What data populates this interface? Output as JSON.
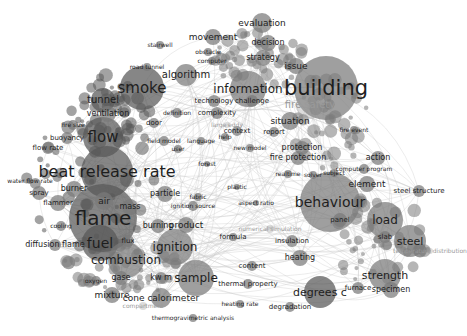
{
  "visualization": {
    "type": "keyword co-occurrence network",
    "background": "#ffffff",
    "edge_color": "#c8c8c8",
    "node_colors": {
      "dark": "#585858",
      "mid": "#7a7a7a",
      "light": "#9c9c9c"
    }
  },
  "nodes": [
    {
      "label": "building",
      "x": 326,
      "y": 88,
      "r": 32,
      "fs": 21,
      "shade": "mid"
    },
    {
      "label": "flame",
      "x": 103,
      "y": 218,
      "r": 34,
      "fs": 20,
      "shade": "dark"
    },
    {
      "label": "beat release rate",
      "x": 107,
      "y": 172,
      "r": 26,
      "fs": 16,
      "shade": "dark"
    },
    {
      "label": "behaviour",
      "x": 330,
      "y": 202,
      "r": 30,
      "fs": 14,
      "shade": "mid"
    },
    {
      "label": "smoke",
      "x": 142,
      "y": 88,
      "r": 22,
      "fs": 15,
      "shade": "dark"
    },
    {
      "label": "flow",
      "x": 103,
      "y": 137,
      "r": 20,
      "fs": 15,
      "shade": "dark"
    },
    {
      "label": "fuel",
      "x": 100,
      "y": 243,
      "r": 18,
      "fs": 14,
      "shade": "dark"
    },
    {
      "label": "information",
      "x": 248,
      "y": 89,
      "r": 18,
      "fs": 12,
      "shade": "mid"
    },
    {
      "label": "combustion",
      "x": 126,
      "y": 260,
      "r": 18,
      "fs": 12,
      "shade": "mid"
    },
    {
      "label": "ignition",
      "x": 175,
      "y": 247,
      "r": 18,
      "fs": 12,
      "shade": "mid"
    },
    {
      "label": "sample",
      "x": 196,
      "y": 278,
      "r": 18,
      "fs": 12,
      "shade": "mid"
    },
    {
      "label": "load",
      "x": 385,
      "y": 220,
      "r": 18,
      "fs": 12,
      "shade": "mid"
    },
    {
      "label": "steel",
      "x": 410,
      "y": 241,
      "r": 16,
      "fs": 11,
      "shade": "mid"
    },
    {
      "label": "strength",
      "x": 385,
      "y": 275,
      "r": 16,
      "fs": 11,
      "shade": "mid"
    },
    {
      "label": "degrees c",
      "x": 320,
      "y": 292,
      "r": 16,
      "fs": 11,
      "shade": "dark"
    },
    {
      "label": "fire safety",
      "x": 310,
      "y": 105,
      "r": 14,
      "fs": 10,
      "shade": "light",
      "faint": true
    },
    {
      "label": "tunnel",
      "x": 103,
      "y": 100,
      "r": 12,
      "fs": 10,
      "shade": "dark"
    },
    {
      "label": "algorithm",
      "x": 186,
      "y": 75,
      "r": 11,
      "fs": 10,
      "shade": "mid"
    },
    {
      "label": "evaluation",
      "x": 262,
      "y": 23,
      "r": 10,
      "fs": 9,
      "shade": "mid"
    },
    {
      "label": "movement",
      "x": 213,
      "y": 37,
      "r": 8,
      "fs": 9,
      "shade": "mid"
    },
    {
      "label": "decision",
      "x": 268,
      "y": 43,
      "r": 8,
      "fs": 8,
      "shade": "mid"
    },
    {
      "label": "strategy",
      "x": 263,
      "y": 58,
      "r": 8,
      "fs": 8,
      "shade": "mid"
    },
    {
      "label": "issue",
      "x": 296,
      "y": 66,
      "r": 8,
      "fs": 9,
      "shade": "mid"
    },
    {
      "label": "situation",
      "x": 290,
      "y": 121,
      "r": 9,
      "fs": 9,
      "shade": "mid"
    },
    {
      "label": "ventilation",
      "x": 108,
      "y": 114,
      "r": 8,
      "fs": 8,
      "shade": "mid"
    },
    {
      "label": "technology",
      "x": 214,
      "y": 101,
      "r": 6,
      "fs": 7,
      "shade": "mid"
    },
    {
      "label": "challenge",
      "x": 252,
      "y": 101,
      "r": 6,
      "fs": 7,
      "shade": "mid"
    },
    {
      "label": "complexity",
      "x": 217,
      "y": 113,
      "r": 6,
      "fs": 7,
      "shade": "mid"
    },
    {
      "label": "definition",
      "x": 177,
      "y": 113,
      "r": 5,
      "fs": 6,
      "shade": "mid"
    },
    {
      "label": "context",
      "x": 237,
      "y": 131,
      "r": 5,
      "fs": 7,
      "shade": "mid"
    },
    {
      "label": "report",
      "x": 274,
      "y": 132,
      "r": 5,
      "fs": 7,
      "shade": "mid"
    },
    {
      "label": "protection",
      "x": 302,
      "y": 148,
      "r": 7,
      "fs": 8,
      "shade": "mid"
    },
    {
      "label": "fire protection",
      "x": 298,
      "y": 158,
      "r": 7,
      "fs": 8,
      "shade": "mid"
    },
    {
      "label": "action",
      "x": 378,
      "y": 158,
      "r": 7,
      "fs": 8,
      "shade": "mid"
    },
    {
      "label": "element",
      "x": 367,
      "y": 184,
      "r": 8,
      "fs": 9,
      "shade": "mid"
    },
    {
      "label": "panel",
      "x": 340,
      "y": 220,
      "r": 7,
      "fs": 7,
      "shade": "mid"
    },
    {
      "label": "slab",
      "x": 385,
      "y": 237,
      "r": 6,
      "fs": 7,
      "shade": "mid"
    },
    {
      "label": "steel structure",
      "x": 419,
      "y": 191,
      "r": 6,
      "fs": 7,
      "shade": "mid"
    },
    {
      "label": "computer program",
      "x": 364,
      "y": 169,
      "r": 5,
      "fs": 6,
      "shade": "mid"
    },
    {
      "label": "specimen",
      "x": 391,
      "y": 290,
      "r": 8,
      "fs": 8,
      "shade": "mid"
    },
    {
      "label": "furnace",
      "x": 358,
      "y": 288,
      "r": 6,
      "fs": 7,
      "shade": "mid"
    },
    {
      "label": "heating",
      "x": 300,
      "y": 258,
      "r": 8,
      "fs": 8,
      "shade": "mid"
    },
    {
      "label": "insulation",
      "x": 292,
      "y": 241,
      "r": 6,
      "fs": 7,
      "shade": "mid"
    },
    {
      "label": "content",
      "x": 252,
      "y": 266,
      "r": 5,
      "fs": 7,
      "shade": "mid"
    },
    {
      "label": "degradation",
      "x": 290,
      "y": 307,
      "r": 5,
      "fs": 7,
      "shade": "mid"
    },
    {
      "label": "thermal property",
      "x": 248,
      "y": 284,
      "r": 5,
      "fs": 7,
      "shade": "mid"
    },
    {
      "label": "heating rate",
      "x": 240,
      "y": 304,
      "r": 4,
      "fs": 6,
      "shade": "mid"
    },
    {
      "label": "thermogravimetric analysis",
      "x": 193,
      "y": 318,
      "r": 4,
      "fs": 6,
      "shade": "mid"
    },
    {
      "label": "cone calorimeter",
      "x": 161,
      "y": 298,
      "r": 10,
      "fs": 9,
      "shade": "mid"
    },
    {
      "label": "mixture",
      "x": 112,
      "y": 295,
      "r": 8,
      "fs": 9,
      "shade": "mid"
    },
    {
      "label": "gase",
      "x": 121,
      "y": 278,
      "r": 7,
      "fs": 8,
      "shade": "mid"
    },
    {
      "label": "kw m",
      "x": 161,
      "y": 278,
      "r": 6,
      "fs": 8,
      "shade": "mid"
    },
    {
      "label": "oxygen",
      "x": 96,
      "y": 281,
      "r": 5,
      "fs": 6,
      "shade": "mid"
    },
    {
      "label": "product",
      "x": 186,
      "y": 225,
      "r": 8,
      "fs": 9,
      "shade": "mid"
    },
    {
      "label": "burning",
      "x": 158,
      "y": 226,
      "r": 7,
      "fs": 8,
      "shade": "mid"
    },
    {
      "label": "particle",
      "x": 165,
      "y": 194,
      "r": 8,
      "fs": 8,
      "shade": "mid"
    },
    {
      "label": "ignition source",
      "x": 193,
      "y": 206,
      "r": 5,
      "fs": 6,
      "shade": "mid"
    },
    {
      "label": "fabric",
      "x": 198,
      "y": 197,
      "r": 4,
      "fs": 6,
      "shade": "mid"
    },
    {
      "label": "mass",
      "x": 130,
      "y": 207,
      "r": 8,
      "fs": 8,
      "shade": "mid"
    },
    {
      "label": "air",
      "x": 104,
      "y": 201,
      "r": 9,
      "fs": 9,
      "shade": "mid"
    },
    {
      "label": "flux",
      "x": 128,
      "y": 241,
      "r": 6,
      "fs": 7,
      "shade": "mid"
    },
    {
      "label": "burner",
      "x": 74,
      "y": 189,
      "r": 8,
      "fs": 8,
      "shade": "mid"
    },
    {
      "label": "flammer",
      "x": 58,
      "y": 203,
      "r": 8,
      "fs": 7,
      "shade": "mid"
    },
    {
      "label": "spray",
      "x": 39,
      "y": 193,
      "r": 7,
      "fs": 7,
      "shade": "mid"
    },
    {
      "label": "water flow rate",
      "x": 30,
      "y": 181,
      "r": 3,
      "fs": 6,
      "shade": "mid"
    },
    {
      "label": "cooling",
      "x": 61,
      "y": 226,
      "r": 5,
      "fs": 6,
      "shade": "mid"
    },
    {
      "label": "diffusion flame",
      "x": 55,
      "y": 245,
      "r": 6,
      "fs": 8,
      "shade": "mid"
    },
    {
      "label": "buoyancy",
      "x": 67,
      "y": 138,
      "r": 6,
      "fs": 7,
      "shade": "mid"
    },
    {
      "label": "flow rate",
      "x": 48,
      "y": 148,
      "r": 6,
      "fs": 7,
      "shade": "mid"
    },
    {
      "label": "fire size",
      "x": 73,
      "y": 125,
      "r": 5,
      "fs": 6,
      "shade": "mid"
    },
    {
      "label": "road tunnel",
      "x": 147,
      "y": 67,
      "r": 4,
      "fs": 6,
      "shade": "mid"
    },
    {
      "label": "stairwell",
      "x": 160,
      "y": 45,
      "r": 4,
      "fs": 6,
      "shade": "mid"
    },
    {
      "label": "obstacle",
      "x": 208,
      "y": 52,
      "r": 4,
      "fs": 6,
      "shade": "mid"
    },
    {
      "label": "computer",
      "x": 212,
      "y": 61,
      "r": 4,
      "fs": 6,
      "shade": "mid"
    },
    {
      "label": "door",
      "x": 154,
      "y": 123,
      "r": 5,
      "fs": 7,
      "shade": "mid"
    },
    {
      "label": "field model",
      "x": 164,
      "y": 141,
      "r": 5,
      "fs": 6,
      "shade": "mid"
    },
    {
      "label": "language",
      "x": 201,
      "y": 141,
      "r": 4,
      "fs": 6,
      "shade": "mid"
    },
    {
      "label": "help",
      "x": 225,
      "y": 137,
      "r": 4,
      "fs": 6,
      "shade": "mid"
    },
    {
      "label": "new model",
      "x": 250,
      "y": 148,
      "r": 4,
      "fs": 6,
      "shade": "mid"
    },
    {
      "label": "user",
      "x": 178,
      "y": 149,
      "r": 4,
      "fs": 6,
      "shade": "mid"
    },
    {
      "label": "forest",
      "x": 207,
      "y": 164,
      "r": 3,
      "fs": 6,
      "shade": "mid"
    },
    {
      "label": "plastic",
      "x": 237,
      "y": 187,
      "r": 3,
      "fs": 6,
      "shade": "mid"
    },
    {
      "label": "aspect ratio",
      "x": 256,
      "y": 203,
      "r": 3,
      "fs": 6,
      "shade": "mid"
    },
    {
      "label": "formula",
      "x": 233,
      "y": 237,
      "r": 4,
      "fs": 7,
      "shade": "mid"
    },
    {
      "label": "fire event",
      "x": 354,
      "y": 130,
      "r": 4,
      "fs": 6,
      "shade": "mid"
    },
    {
      "label": "realtime",
      "x": 288,
      "y": 174,
      "r": 4,
      "fs": 6,
      "shade": "mid"
    },
    {
      "label": "subject",
      "x": 334,
      "y": 173,
      "r": 4,
      "fs": 6,
      "shade": "mid"
    },
    {
      "label": "solver",
      "x": 313,
      "y": 175,
      "r": 4,
      "fs": 6,
      "shade": "mid"
    },
    {
      "label": "large eddy",
      "x": 227,
      "y": 125,
      "r": 3,
      "fs": 6,
      "shade": "light",
      "faint": true
    },
    {
      "label": "numerical simulation",
      "x": 270,
      "y": 229,
      "r": 4,
      "fs": 6,
      "shade": "light",
      "faint": true
    },
    {
      "label": "compartment",
      "x": 143,
      "y": 306,
      "r": 4,
      "fs": 6,
      "shade": "light",
      "faint": true
    },
    {
      "label": "temperature distribution",
      "x": 430,
      "y": 251,
      "r": 3,
      "fs": 6,
      "shade": "light",
      "faint": true
    }
  ]
}
